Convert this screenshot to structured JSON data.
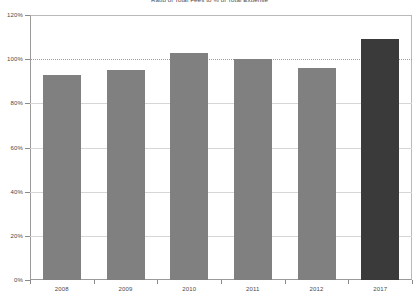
{
  "chart_data": {
    "type": "bar",
    "title": "Ratio of Total Fees to % of Total Expense",
    "xlabel": "",
    "ylabel": "",
    "categories": [
      "2008",
      "2009",
      "2010",
      "2011",
      "2012",
      "2017"
    ],
    "values": [
      93,
      95,
      103,
      100,
      96,
      109
    ],
    "value_suffix": "%",
    "ylim": [
      0,
      120
    ],
    "yticks": [
      "0%",
      "20%",
      "40%",
      "60%",
      "80%",
      "100%",
      "120%"
    ],
    "ytick_values": [
      0,
      20,
      40,
      60,
      80,
      100,
      120
    ],
    "grid": true,
    "gridlines_at": [
      20,
      40,
      60,
      80,
      100
    ],
    "reference_line": 100,
    "legend": "none",
    "series": [
      {
        "name": "Ratio of Total Fees to % of Total Expense",
        "values": [
          93,
          95,
          103,
          100,
          96,
          109
        ]
      }
    ],
    "bar_colors": [
      "#808080",
      "#808080",
      "#808080",
      "#808080",
      "#808080",
      "#3a3a3a"
    ],
    "colors": {
      "bar_default": "#808080",
      "bar_highlight": "#3a3a3a",
      "axis": "#8a8a8a",
      "grid": "#d6d6d6",
      "reference_grid": "#a0a0a0",
      "text": "#4a4a4a",
      "background": "#ffffff"
    }
  }
}
